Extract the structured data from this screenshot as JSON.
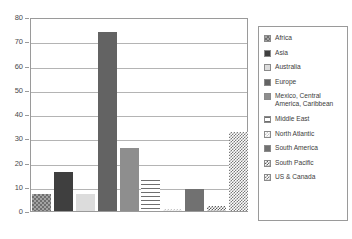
{
  "chart_data": {
    "type": "bar",
    "title": "",
    "xlabel": "",
    "ylabel": "",
    "ylim": [
      0,
      80
    ],
    "y_ticks": [
      0,
      10,
      20,
      30,
      40,
      50,
      60,
      70,
      80
    ],
    "grid": true,
    "legend_position": "right",
    "categories": [
      "Africa",
      "Asia",
      "Australia",
      "Europe",
      "Mexico, Central America, Caribbean",
      "Middle East",
      "North Atlantic",
      "South America",
      "South Pacific",
      "US & Canada"
    ],
    "values": [
      7,
      16,
      7,
      74,
      26,
      13,
      1,
      9,
      2,
      32.5
    ]
  },
  "legend": {
    "items": [
      {
        "label": "Africa",
        "pattern": "pat-africa"
      },
      {
        "label": "Asia",
        "pattern": "pat-asia"
      },
      {
        "label": "Australia",
        "pattern": "pat-australia"
      },
      {
        "label": "Europe",
        "pattern": "pat-europe"
      },
      {
        "label": "Mexico, Central\nAmerica, Caribbean",
        "pattern": "pat-mexico"
      },
      {
        "label": "Middle East",
        "pattern": "pat-middleeast"
      },
      {
        "label": "North Atlantic",
        "pattern": "pat-northatlantic"
      },
      {
        "label": "South America",
        "pattern": "pat-southamerica"
      },
      {
        "label": "South Pacific",
        "pattern": "pat-southpacific"
      },
      {
        "label": "US & Canada",
        "pattern": "pat-uscanada"
      }
    ]
  },
  "axis": {
    "tick_labels": [
      "80",
      "70",
      "60",
      "50",
      "40",
      "30",
      "20",
      "10",
      "0"
    ]
  },
  "colors": {
    "frame": "#9a9a9a",
    "gridline": "#b4b4b4",
    "tick_text": "#4a4a4a",
    "legend_text": "#3c3c3c",
    "background": "#ffffff"
  }
}
